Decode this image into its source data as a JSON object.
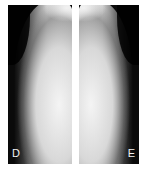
{
  "figure": {
    "panels": [
      {
        "id": "left",
        "label": "D",
        "type": "radiograph"
      },
      {
        "id": "right",
        "label": "E",
        "type": "radiograph"
      }
    ],
    "colors": {
      "background": "#ffffff",
      "film_dark": "#0a0a0a",
      "label": "#f2f2f2"
    }
  }
}
